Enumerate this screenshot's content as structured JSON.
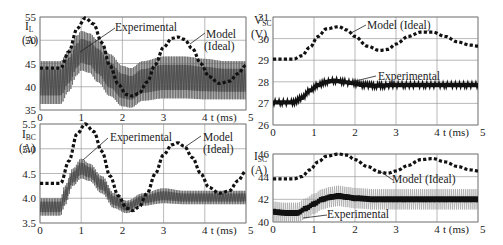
{
  "chart_data": [
    {
      "id": "iL",
      "type": "line",
      "ylabel": "I_L (A)",
      "ylabel_main": "I",
      "ylabel_sub": "L",
      "ylabel_unit": "(A)",
      "xlabel": "t (ms)",
      "xlim": [
        0,
        5
      ],
      "ylim": [
        35,
        55
      ],
      "xticks": [
        "0",
        "1",
        "2",
        "3",
        "4",
        "5"
      ],
      "yticks": [
        "35",
        "40",
        "45",
        "50",
        "55"
      ],
      "grid": true,
      "annotations": [
        "Experimental",
        "Model (Ideal)"
      ],
      "series": [
        {
          "name": "Model (Ideal)",
          "style": "dashed",
          "x": [
            0,
            0.5,
            0.7,
            0.9,
            1.1,
            1.3,
            1.5,
            1.7,
            1.9,
            2.1,
            2.25,
            2.4,
            2.6,
            2.8,
            3.0,
            3.2,
            3.35,
            3.5,
            3.7,
            3.9,
            4.1,
            4.35,
            4.6,
            4.8,
            5.0
          ],
          "y": [
            44,
            44,
            47.5,
            52.5,
            54.8,
            53.5,
            49.5,
            44.5,
            40.5,
            38.3,
            38,
            38.6,
            41,
            44.8,
            48.5,
            50.4,
            50.7,
            50.2,
            48.2,
            45,
            42.2,
            40.7,
            41.2,
            42.8,
            44.6
          ]
        },
        {
          "name": "Experimental (envelope upper)",
          "style": "band",
          "x": [
            0,
            0.5,
            0.7,
            0.9,
            1.0,
            1.2,
            1.4,
            1.7,
            2.0,
            2.2,
            2.5,
            3.0,
            3.5,
            4.0,
            4.5,
            5.0
          ],
          "y": [
            45.5,
            45.5,
            48,
            51,
            52,
            51.5,
            50,
            47,
            44.5,
            44,
            45.5,
            46.5,
            46.5,
            46,
            45.5,
            45.5
          ]
        },
        {
          "name": "Experimental (envelope lower)",
          "style": "band",
          "x": [
            0,
            0.5,
            0.7,
            0.9,
            1.0,
            1.2,
            1.4,
            1.7,
            2.0,
            2.2,
            2.5,
            3.0,
            3.5,
            4.0,
            4.5,
            5.0
          ],
          "y": [
            36.3,
            36.3,
            39,
            42.5,
            43.5,
            43,
            41,
            38,
            35.8,
            35.5,
            37,
            37.5,
            37.5,
            37.3,
            37.3,
            37.3
          ]
        }
      ]
    },
    {
      "id": "iBC",
      "type": "line",
      "ylabel": "I_BC (A)",
      "ylabel_main": "I",
      "ylabel_sub": "BC",
      "ylabel_unit": "(A)",
      "xlabel": "t (ms)",
      "xlim": [
        0,
        5
      ],
      "ylim": [
        3.5,
        5.5
      ],
      "xticks": [
        "0",
        "1",
        "2",
        "3",
        "4",
        "5"
      ],
      "yticks": [
        "3.5",
        "4.0",
        "4.5",
        "5.0",
        "5.5"
      ],
      "grid": true,
      "annotations": [
        "Experimental",
        "Model (Ideal)"
      ],
      "series": [
        {
          "name": "Model (Ideal)",
          "style": "dashed",
          "x": [
            0,
            0.5,
            0.7,
            0.9,
            1.1,
            1.3,
            1.5,
            1.7,
            1.9,
            2.1,
            2.25,
            2.4,
            2.6,
            2.8,
            3.0,
            3.2,
            3.35,
            3.5,
            3.7,
            3.9,
            4.1,
            4.35,
            4.6,
            4.8,
            5.0
          ],
          "y": [
            4.3,
            4.3,
            4.75,
            5.3,
            5.5,
            5.35,
            4.95,
            4.45,
            4.05,
            3.8,
            3.75,
            3.82,
            4.1,
            4.5,
            4.88,
            5.08,
            5.12,
            5.05,
            4.82,
            4.5,
            4.22,
            4.1,
            4.15,
            4.35,
            4.55
          ]
        },
        {
          "name": "Experimental (envelope upper)",
          "style": "band",
          "x": [
            0,
            0.5,
            0.6,
            0.8,
            1.0,
            1.2,
            1.5,
            1.8,
            2.1,
            2.5,
            3.0,
            3.5,
            4.0,
            4.5,
            5.0
          ],
          "y": [
            4.0,
            4.0,
            4.25,
            4.6,
            4.8,
            4.7,
            4.45,
            4.1,
            3.95,
            4.1,
            4.2,
            4.15,
            4.15,
            4.15,
            4.15
          ]
        },
        {
          "name": "Experimental (envelope lower)",
          "style": "band",
          "x": [
            0,
            0.5,
            0.6,
            0.8,
            1.0,
            1.2,
            1.5,
            1.8,
            2.1,
            2.5,
            3.0,
            3.5,
            4.0,
            4.5,
            5.0
          ],
          "y": [
            3.65,
            3.65,
            3.85,
            4.25,
            4.4,
            4.35,
            4.1,
            3.8,
            3.7,
            3.85,
            3.9,
            3.88,
            3.88,
            3.88,
            3.88
          ]
        }
      ]
    },
    {
      "id": "vSC",
      "type": "line",
      "ylabel": "V_SC (V)",
      "ylabel_main": "V",
      "ylabel_sub": "SC",
      "ylabel_unit": "(V)",
      "xlabel": "t (ms)",
      "xlim": [
        0,
        5
      ],
      "ylim": [
        26,
        31
      ],
      "xticks": [
        "0",
        "1",
        "2",
        "3",
        "4",
        "5"
      ],
      "yticks": [
        "26",
        "27",
        "28",
        "29",
        "30",
        "31"
      ],
      "grid": true,
      "annotations": [
        "Model (Ideal)",
        "Experimental"
      ],
      "series": [
        {
          "name": "Model (Ideal)",
          "style": "dashed",
          "x": [
            0,
            0.5,
            0.7,
            0.9,
            1.1,
            1.3,
            1.6,
            1.8,
            2.0,
            2.3,
            2.6,
            2.8,
            3.0,
            3.3,
            3.6,
            3.9,
            4.2,
            4.5,
            4.8,
            5.0
          ],
          "y": [
            29.05,
            29.05,
            29.2,
            29.6,
            30.1,
            30.45,
            30.55,
            30.4,
            30.1,
            29.65,
            29.45,
            29.5,
            29.75,
            30.1,
            30.3,
            30.3,
            30.1,
            29.85,
            29.7,
            29.65
          ]
        },
        {
          "name": "Experimental",
          "style": "thick",
          "x": [
            0,
            0.5,
            0.7,
            0.9,
            1.1,
            1.3,
            1.5,
            1.7,
            1.9,
            2.2,
            2.5,
            3.0,
            3.5,
            4.0,
            4.5,
            5.0
          ],
          "y": [
            27.05,
            27.05,
            27.25,
            27.6,
            27.85,
            28.0,
            28.05,
            28.0,
            27.95,
            27.85,
            27.82,
            27.85,
            27.85,
            27.85,
            27.85,
            27.85
          ]
        }
      ]
    },
    {
      "id": "iSC",
      "type": "line",
      "ylabel": "I_SC (A)",
      "ylabel_main": "I",
      "ylabel_sub": "SC",
      "ylabel_unit": "(A)",
      "xlabel": "t (ms)",
      "xlim": [
        0,
        5
      ],
      "ylim": [
        40,
        46
      ],
      "xticks": [
        "0",
        "1",
        "2",
        "3",
        "4",
        "5"
      ],
      "yticks": [
        "40",
        "42",
        "44",
        "46"
      ],
      "grid": true,
      "annotations": [
        "Model (Ideal)",
        "Experimental"
      ],
      "series": [
        {
          "name": "Model (Ideal)",
          "style": "dashed",
          "x": [
            0,
            0.5,
            0.7,
            0.9,
            1.1,
            1.3,
            1.6,
            1.8,
            2.0,
            2.3,
            2.6,
            2.8,
            3.0,
            3.3,
            3.6,
            3.9,
            4.2,
            4.5,
            4.8,
            5.0
          ],
          "y": [
            43.8,
            43.8,
            44.0,
            44.6,
            45.3,
            45.8,
            46.0,
            45.9,
            45.5,
            44.9,
            44.4,
            44.3,
            44.5,
            45.0,
            45.5,
            45.6,
            45.3,
            44.9,
            44.6,
            44.5
          ]
        },
        {
          "name": "Experimental",
          "style": "thick",
          "x": [
            0,
            0.3,
            0.6,
            0.8,
            1.0,
            1.2,
            1.4,
            1.6,
            1.8,
            2.0,
            2.5,
            3.0,
            3.5,
            4.0,
            4.5,
            5.0
          ],
          "y": [
            40.9,
            40.8,
            40.8,
            41.2,
            41.6,
            42.0,
            42.2,
            42.3,
            42.2,
            42.1,
            42.0,
            42.0,
            42.0,
            42.0,
            42.0,
            42.0
          ]
        }
      ]
    }
  ],
  "labels": {
    "experimental": "Experimental",
    "model_line1": "Model",
    "model_line2": "(Ideal)",
    "model_full": "Model (Ideal)",
    "time_axis": "t (ms)"
  }
}
